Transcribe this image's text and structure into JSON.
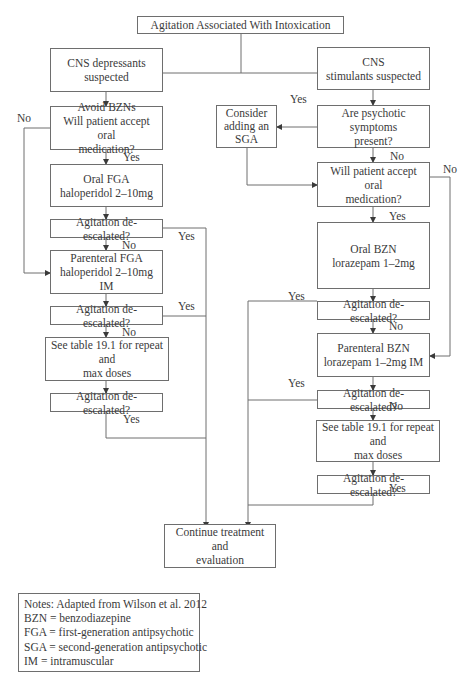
{
  "flowchart": {
    "title": "Agitation Associated With Intoxication",
    "left": {
      "start": "CNS depressants\nsuspected",
      "q_oral": "Avoid BZNs\nWill patient accept oral\nmedication?",
      "oral": "Oral FGA\nhaloperidol 2–10mg",
      "check1": "Agitation de-escalated?",
      "parenteral": "Parenteral FGA\nhaloperidol 2–10mg IM",
      "check2": "Agitation de-escalated?",
      "table": "See table 19.1 for repeat and\nmax doses",
      "check3": "Agitation de-escalated?"
    },
    "right": {
      "start": "CNS\nstimulants suspected",
      "q_psych": "Are psychotic symptoms\npresent?",
      "sga": "Consider\nadding an\nSGA",
      "q_oral": "Will patient accept oral\nmedication?",
      "oral": "Oral BZN\nlorazepam 1–2mg",
      "check1": "Agitation de-escalated?",
      "parenteral": "Parenteral BZN\nlorazepam 1–2mg IM",
      "check2": "Agitation de-escalated?",
      "table": "See table 19.1 for repeat and\nmax doses",
      "check3": "Agitation de-escalated?"
    },
    "end": "Continue treatment and\nevaluation",
    "labels": {
      "yes": "Yes",
      "no": "No"
    }
  },
  "notes": {
    "lines": [
      "Notes: Adapted from Wilson et al. 2012",
      "BZN = benzodiazepine",
      "FGA = first-generation antipsychotic",
      "SGA = second-generation antipsychotic",
      "IM = intramuscular"
    ]
  },
  "colors": {
    "line": "#6e6e6e",
    "text": "#3a3a3a",
    "background": "#ffffff"
  }
}
